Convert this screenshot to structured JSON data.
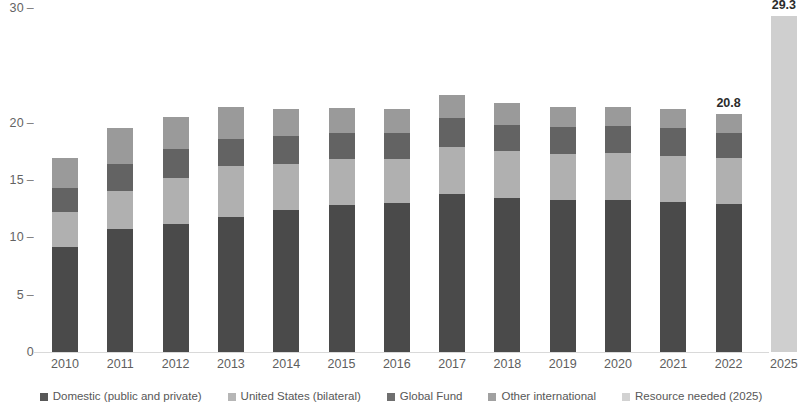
{
  "chart_data": {
    "type": "bar",
    "subtype": "stacked-bar",
    "title": "",
    "subtitle": "",
    "xlabel": "",
    "ylabel": "",
    "ylim": [
      0,
      30
    ],
    "y_ticks": [
      0,
      5,
      10,
      15,
      20,
      30
    ],
    "y_tick_labels": [
      "0",
      "5",
      "10",
      "15",
      "20",
      "30"
    ],
    "grid": false,
    "legend_position": "bottom",
    "categories": [
      "2010",
      "2011",
      "2012",
      "2013",
      "2014",
      "2015",
      "2016",
      "2017",
      "2018",
      "2019",
      "2020",
      "2021",
      "2022",
      "2025"
    ],
    "series": [
      {
        "name": "Domestic (public and private)",
        "color": "#4a4a4a",
        "values": [
          9.2,
          10.7,
          11.2,
          11.8,
          12.4,
          12.8,
          13.0,
          13.8,
          13.4,
          13.3,
          13.3,
          13.1,
          12.9,
          0
        ]
      },
      {
        "name": "United States (bilateral)",
        "color": "#b0b0b0",
        "values": [
          3.0,
          3.3,
          4.0,
          4.4,
          4.0,
          4.0,
          3.8,
          4.1,
          4.1,
          4.0,
          4.1,
          4.0,
          4.0,
          0
        ]
      },
      {
        "name": "Global Fund",
        "color": "#636363",
        "values": [
          2.1,
          2.4,
          2.5,
          2.4,
          2.4,
          2.3,
          2.3,
          2.5,
          2.3,
          2.3,
          2.3,
          2.4,
          2.2,
          0
        ]
      },
      {
        "name": "Other international",
        "color": "#9a9a9a",
        "values": [
          2.6,
          3.1,
          2.8,
          2.8,
          2.4,
          2.2,
          2.1,
          2.0,
          1.9,
          1.8,
          1.7,
          1.7,
          1.7,
          0
        ]
      },
      {
        "name": "Resource needed (2025)",
        "color": "#cfcfcf",
        "values": [
          0,
          0,
          0,
          0,
          0,
          0,
          0,
          0,
          0,
          0,
          0,
          0,
          0,
          29.3
        ]
      }
    ],
    "totals": [
      16.9,
      19.5,
      20.5,
      21.4,
      21.2,
      21.3,
      21.2,
      22.4,
      21.7,
      21.4,
      21.4,
      21.2,
      20.8,
      29.3
    ],
    "data_labels": [
      {
        "category": "2022",
        "value": "20.8"
      },
      {
        "category": "2025",
        "value": "29.3"
      }
    ]
  },
  "axis": {
    "y_tick_dash": "–",
    "ticks": [
      {
        "label": "30",
        "value": 30
      },
      {
        "label": "20",
        "value": 20
      },
      {
        "label": "15",
        "value": 15
      },
      {
        "label": "10",
        "value": 10
      },
      {
        "label": "5",
        "value": 5
      },
      {
        "label": "0",
        "value": 0
      }
    ]
  },
  "legend": {
    "items": [
      {
        "label": "Domestic (public and private)",
        "color": "#4a4a4a"
      },
      {
        "label": "United States (bilateral)",
        "color": "#b0b0b0"
      },
      {
        "label": "Global Fund",
        "color": "#636363"
      },
      {
        "label": "Other international",
        "color": "#9a9a9a"
      },
      {
        "label": "Resource needed (2025)",
        "color": "#cfcfcf"
      }
    ]
  }
}
